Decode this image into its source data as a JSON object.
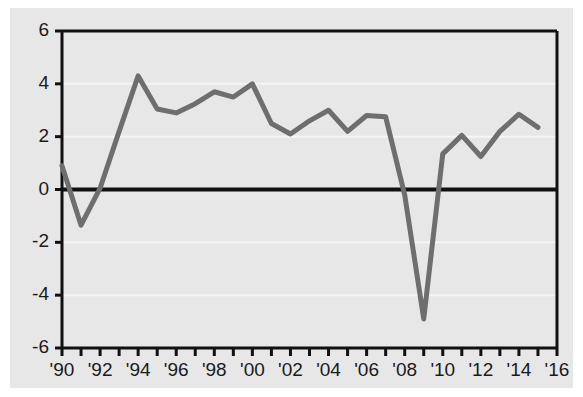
{
  "chart_data": {
    "type": "line",
    "title": "",
    "subtitle": "",
    "xlabel": "",
    "ylabel": "",
    "xlim": [
      1990,
      2016
    ],
    "ylim": [
      -6,
      6
    ],
    "grid": true,
    "legend_position": "none",
    "line_color": "#6e6e6e",
    "zero_line_color": "#111111",
    "axis_color": "#111111",
    "gridline_color": "#f5f5f5",
    "background_color": "#e7e7e7",
    "page_background_color": "#ffffff",
    "y_ticks": [
      6,
      4,
      2,
      0,
      -2,
      -4,
      -6
    ],
    "y_tick_labels": [
      "6",
      "4",
      "2",
      "0",
      "-2",
      "-4",
      "-6"
    ],
    "x_ticks": [
      1990,
      1992,
      1994,
      1996,
      1998,
      2000,
      2002,
      2004,
      2006,
      2008,
      2010,
      2012,
      2014,
      2016
    ],
    "x_tick_labels": [
      "'90",
      "'92",
      "'94",
      "'96",
      "'98",
      "'00",
      "'02",
      "'04",
      "'06",
      "'08",
      "'10",
      "'12",
      "'14",
      "'16"
    ],
    "x_minor_ticks": [
      1991,
      1993,
      1995,
      1997,
      1999,
      2001,
      2003,
      2005,
      2007,
      2009,
      2011,
      2013,
      2015
    ],
    "x": [
      1990,
      1991,
      1992,
      1993,
      1994,
      1995,
      1996,
      1997,
      1998,
      1999,
      2000,
      2001,
      2002,
      2003,
      2004,
      2005,
      2006,
      2007,
      2008,
      2009,
      2010,
      2011,
      2012,
      2013,
      2014,
      2015
    ],
    "values": [
      0.9,
      -1.35,
      0.05,
      2.2,
      4.3,
      3.05,
      2.9,
      3.25,
      3.7,
      3.5,
      4.0,
      2.5,
      2.1,
      2.6,
      3.0,
      2.2,
      2.8,
      2.75,
      -0.2,
      -4.9,
      1.35,
      2.05,
      1.25,
      2.2,
      2.85,
      2.35
    ],
    "series": [
      {
        "name": "series-1",
        "color": "#6e6e6e",
        "values": [
          0.9,
          -1.35,
          0.05,
          2.2,
          4.3,
          3.05,
          2.9,
          3.25,
          3.7,
          3.5,
          4.0,
          2.5,
          2.1,
          2.6,
          3.0,
          2.2,
          2.8,
          2.75,
          -0.2,
          -4.9,
          1.35,
          2.05,
          1.25,
          2.2,
          2.85,
          2.35
        ]
      }
    ]
  }
}
